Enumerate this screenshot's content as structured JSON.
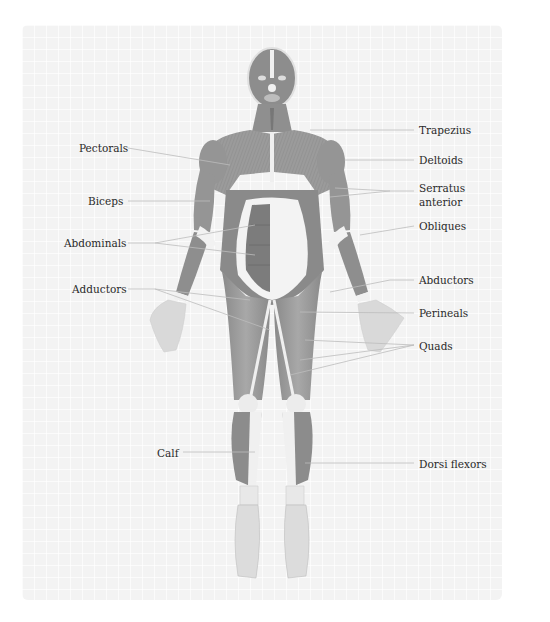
{
  "diagram": {
    "colors": {
      "background_panel": "#f3f3f3",
      "muscle_dark": "#7e7e7e",
      "muscle_mid": "#9a9a9a",
      "tendon_light": "#f2f2f2",
      "leader_line": "#bdbdbd",
      "label_text": "#2a2a2a"
    },
    "labels_left": [
      {
        "id": "pectorals",
        "text": "Pectorals",
        "x": 79,
        "y": 141,
        "line": [
          [
            128,
            148
          ],
          [
            230,
            165
          ]
        ]
      },
      {
        "id": "biceps",
        "text": "Biceps",
        "x": 88,
        "y": 194,
        "line": [
          [
            128,
            201
          ],
          [
            210,
            201
          ]
        ]
      },
      {
        "id": "abdominals",
        "text": "Abdominals",
        "x": 64,
        "y": 236,
        "line": [
          [
            128,
            243
          ],
          [
            155,
            243
          ],
          [
            255,
            225
          ]
        ],
        "line2": [
          [
            155,
            243
          ],
          [
            255,
            255
          ]
        ]
      },
      {
        "id": "adductors",
        "text": "Adductors",
        "x": 72,
        "y": 282,
        "line": [
          [
            128,
            289
          ],
          [
            155,
            289
          ],
          [
            270,
            330
          ]
        ],
        "line2": [
          [
            155,
            289
          ],
          [
            250,
            300
          ]
        ]
      },
      {
        "id": "calf",
        "text": "Calf",
        "x": 157,
        "y": 446,
        "line": [
          [
            183,
            452
          ],
          [
            255,
            452
          ]
        ]
      }
    ],
    "labels_right": [
      {
        "id": "trapezius",
        "text": "Trapezius",
        "x": 419,
        "y": 123,
        "line": [
          [
            310,
            130
          ],
          [
            414,
            130
          ]
        ]
      },
      {
        "id": "deltoids",
        "text": "Deltoids",
        "x": 419,
        "y": 153,
        "line": [
          [
            345,
            160
          ],
          [
            414,
            160
          ]
        ]
      },
      {
        "id": "serratus_anterior",
        "text": "Serratus anterior",
        "lines": [
          "Serratus",
          "anterior"
        ],
        "x": 419,
        "y": 181,
        "line": [
          [
            414,
            191
          ],
          [
            390,
            191
          ],
          [
            335,
            188
          ]
        ],
        "line2": [
          [
            390,
            191
          ],
          [
            330,
            197
          ]
        ]
      },
      {
        "id": "obliques",
        "text": "Obliques",
        "x": 419,
        "y": 219,
        "line": [
          [
            414,
            226
          ],
          [
            360,
            235
          ]
        ]
      },
      {
        "id": "abductors",
        "text": "Abductors",
        "x": 419,
        "y": 273,
        "line": [
          [
            414,
            280
          ],
          [
            390,
            280
          ],
          [
            330,
            292
          ]
        ]
      },
      {
        "id": "perineals",
        "text": "Perineals",
        "x": 419,
        "y": 306,
        "line": [
          [
            414,
            313
          ],
          [
            300,
            312
          ]
        ]
      },
      {
        "id": "quads",
        "text": "Quads",
        "x": 419,
        "y": 339,
        "line": [
          [
            414,
            345
          ],
          [
            305,
            340
          ]
        ],
        "line2": [
          [
            414,
            345
          ],
          [
            290,
            375
          ]
        ],
        "line3": [
          [
            414,
            345
          ],
          [
            300,
            360
          ]
        ]
      },
      {
        "id": "dorsi_flexors",
        "text": "Dorsi flexors",
        "x": 419,
        "y": 457,
        "line": [
          [
            414,
            463
          ],
          [
            305,
            463
          ]
        ]
      }
    ]
  }
}
